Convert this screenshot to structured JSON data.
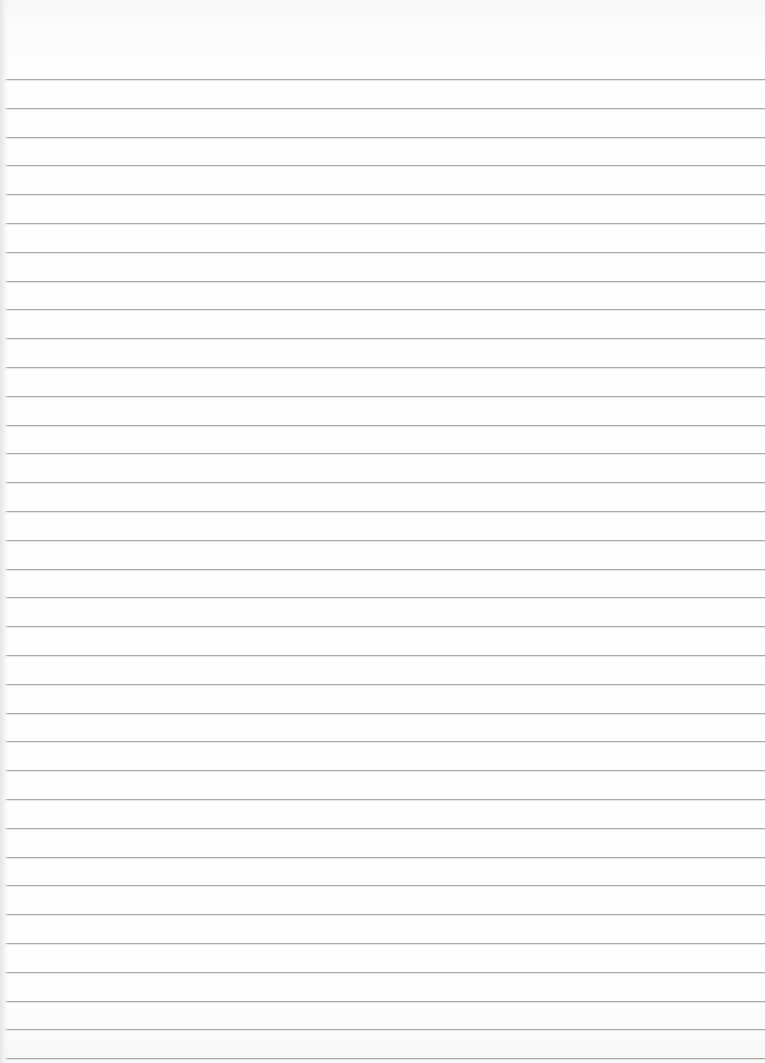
{
  "page": {
    "type": "lined-paper",
    "background_color": "#fdfdfd",
    "line_color": "#a9a9a9",
    "line_count": 35,
    "first_line_y": 79,
    "line_spacing": 28.8
  }
}
